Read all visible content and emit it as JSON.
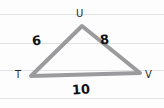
{
  "figure": {
    "kind": "triangle-diagram",
    "stroke_color": "#9b9b9d",
    "label_color": "#17171a",
    "paper_color": "#fdfdfd",
    "rule_color": "#e3e3e5",
    "stroke_width": 4,
    "ruled_lines_y": [
      14,
      43,
      70,
      98
    ],
    "vertices": [
      {
        "name": "U",
        "label": "U",
        "x": 82,
        "y": 26
      },
      {
        "name": "T",
        "label": "T",
        "x": 31,
        "y": 76
      },
      {
        "name": "V",
        "label": "V",
        "x": 140,
        "y": 73
      }
    ],
    "sides": [
      {
        "name": "TU",
        "label": "6",
        "value": 6,
        "from": "T",
        "to": "U"
      },
      {
        "name": "UV",
        "label": "8",
        "value": 8,
        "from": "U",
        "to": "V"
      },
      {
        "name": "TV",
        "label": "10",
        "value": 10,
        "from": "T",
        "to": "V"
      }
    ]
  },
  "chart_data": {
    "type": "diagram",
    "shape": "triangle",
    "vertex_labels": [
      "U",
      "T",
      "V"
    ],
    "side_labels": [
      "6",
      "8",
      "10"
    ],
    "side_values": [
      6,
      8,
      10
    ],
    "side_pairs": [
      [
        "T",
        "U"
      ],
      [
        "U",
        "V"
      ],
      [
        "T",
        "V"
      ]
    ],
    "points": {
      "U": [
        82,
        26
      ],
      "T": [
        31,
        76
      ],
      "V": [
        140,
        73
      ]
    },
    "xlabel": "",
    "ylabel": "",
    "grid": true,
    "legend": "none",
    "annotations": [
      "6",
      "8",
      "10",
      "T",
      "U",
      "V"
    ]
  }
}
